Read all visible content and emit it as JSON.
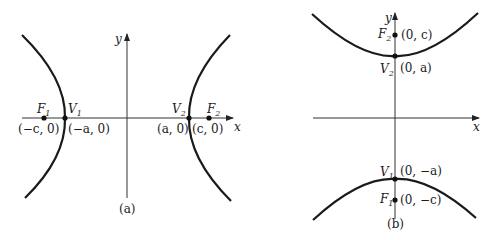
{
  "figure": {
    "panels": [
      {
        "id": "a",
        "caption": "(a)",
        "orientation": "horizontal transverse axis",
        "axes": {
          "x_label": "x",
          "y_label": "y"
        },
        "points": [
          {
            "name": "F",
            "sub": "1",
            "coord": "(−c, 0)"
          },
          {
            "name": "V",
            "sub": "1",
            "coord": "(−a, 0)"
          },
          {
            "name": "V",
            "sub": "2",
            "coord": "(a, 0)"
          },
          {
            "name": "F",
            "sub": "2",
            "coord": "(c, 0)"
          }
        ]
      },
      {
        "id": "b",
        "caption": "(b)",
        "orientation": "vertical transverse axis",
        "axes": {
          "x_label": "x",
          "y_label": "y"
        },
        "points": [
          {
            "name": "F",
            "sub": "2",
            "coord": "(0, c)"
          },
          {
            "name": "V",
            "sub": "2",
            "coord": "(0, a)"
          },
          {
            "name": "V",
            "sub": "1",
            "coord": "(0, −a)"
          },
          {
            "name": "F",
            "sub": "1",
            "coord": "(0, −c)"
          }
        ]
      }
    ],
    "colors": {
      "curve": "#1a1a1a",
      "axis": "#333333",
      "background": "#ffffff"
    }
  }
}
